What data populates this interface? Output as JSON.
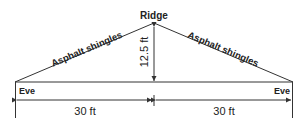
{
  "diagram": {
    "ridge_label": "Ridge",
    "left_slope_label": "Asphalt shingles",
    "right_slope_label": "Asphalt shingles",
    "height_label": "12.5 ft",
    "left_eave_label": "Eve",
    "right_eave_label": "Eve",
    "left_span_label": "30 ft",
    "right_span_label": "30 ft",
    "line_color": "#333333"
  }
}
